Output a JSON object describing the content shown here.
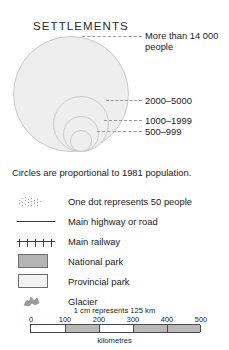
{
  "legend": {
    "title": "SETTLEMENTS",
    "caption": "Circles are proportional to 1981 population.",
    "circle_classes": [
      {
        "label": "More than 14 000\npeople",
        "line1": "More than 14 000",
        "line2": "people"
      },
      {
        "label": "2000–5000"
      },
      {
        "label": "1000–1999"
      },
      {
        "label": "500–999"
      }
    ],
    "entries": [
      {
        "symbol": "dot-cluster",
        "label": "One dot represents 50 people"
      },
      {
        "symbol": "highway-line",
        "label": "Main highway or road"
      },
      {
        "symbol": "railway-line",
        "label": "Main railway"
      },
      {
        "symbol": "national-park-swatch",
        "label": "National park"
      },
      {
        "symbol": "provincial-park-swatch",
        "label": "Provincial park"
      },
      {
        "symbol": "glacier-shape",
        "label": "Glacier"
      }
    ]
  },
  "scale": {
    "statement": "1 cm represents 125 km",
    "ticks": [
      "0",
      "100",
      "200",
      "300",
      "400",
      "500"
    ],
    "units": "kilometres"
  },
  "colors": {
    "circle_fill": "#eeeeee",
    "circle_stroke": "#c9c9c9",
    "national_park": "#b4b4b4",
    "provincial_park": "#f3f3f3",
    "line": "#3a3a3a",
    "leader": "#9a9a9a",
    "text": "#1b1b1b"
  }
}
